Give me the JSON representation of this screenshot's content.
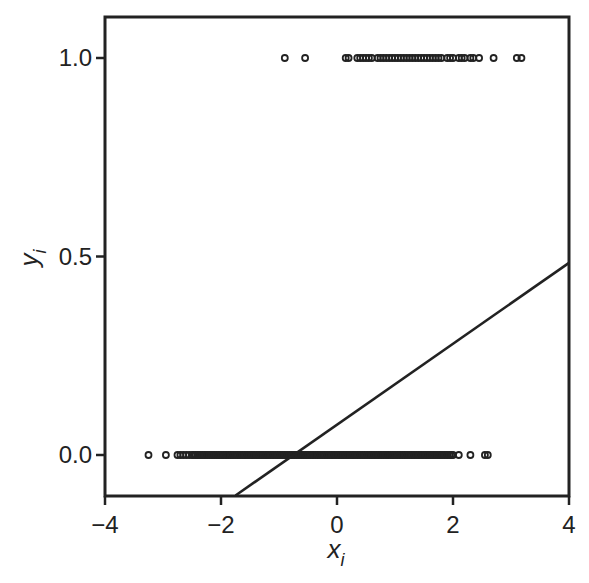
{
  "chart_data": {
    "type": "scatter",
    "title": "",
    "xlabel": "x_i",
    "ylabel": "y_i",
    "xlim": [
      -4,
      4
    ],
    "ylim": [
      -0.1,
      1.1
    ],
    "x_ticks": [
      -4,
      -2,
      0,
      2,
      4
    ],
    "x_tick_labels": [
      "−4",
      "−2",
      "0",
      "2",
      "4"
    ],
    "y_ticks": [
      0.0,
      0.5,
      1.0
    ],
    "y_tick_labels": [
      "0.0",
      "0.5",
      "1.0"
    ],
    "grid": false,
    "legend": null,
    "series": [
      {
        "name": "y=1 observations",
        "marker": "open-circle",
        "y": 1.0,
        "x": [
          -0.9,
          -0.55,
          0.15,
          0.2,
          0.35,
          0.4,
          0.45,
          0.5,
          0.55,
          0.6,
          0.7,
          0.75,
          0.8,
          0.85,
          0.9,
          0.95,
          1.0,
          1.05,
          1.1,
          1.15,
          1.2,
          1.25,
          1.3,
          1.35,
          1.4,
          1.45,
          1.5,
          1.55,
          1.6,
          1.65,
          1.7,
          1.75,
          1.8,
          1.9,
          1.95,
          2.0,
          2.1,
          2.15,
          2.2,
          2.3,
          2.35,
          2.45,
          2.7,
          3.1,
          3.18
        ]
      },
      {
        "name": "y=0 observations",
        "marker": "open-circle",
        "y": 0.0,
        "x_range_dense": [
          -2.5,
          2.0
        ],
        "x_sparse": [
          -3.25,
          -2.95,
          -2.75,
          -2.7,
          -2.65,
          -2.6,
          -2.55,
          2.1,
          2.3,
          2.55,
          2.6
        ]
      },
      {
        "name": "linear fit",
        "type": "line",
        "slope": 0.102,
        "intercept": 0.077,
        "x_range": [
          -1.75,
          4
        ],
        "points": [
          [
            -1.75,
            -0.102
          ],
          [
            4,
            0.484
          ]
        ]
      }
    ]
  },
  "axes": {
    "x_label_main": "x",
    "x_label_sub": "i",
    "y_label_main": "y",
    "y_label_sub": "i"
  },
  "colors": {
    "ink": "#222222",
    "background": "#ffffff"
  }
}
